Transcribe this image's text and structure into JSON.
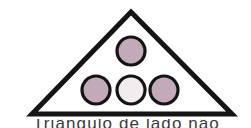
{
  "figure": {
    "background_color": "#ffffff",
    "stroke_color": "#141414",
    "caption": "Triângulo de lado não",
    "shapes": {
      "triangle": {
        "label": "triangle-outline",
        "apex": "131,12",
        "base_left": "32,114",
        "base_right": "232,114",
        "points": "131,12 232,114 32,114",
        "fill": "#ffffff",
        "stroke": "#141414",
        "stroke_width": 5
      },
      "circles": [
        {
          "label": "circle-top",
          "cx": 131,
          "cy": 51,
          "r": 14,
          "fill": "#c2aabb",
          "stroke": "#141414",
          "stroke_width": 3.2
        },
        {
          "label": "circle-bottom-left",
          "cx": 96,
          "cy": 90,
          "r": 14,
          "fill": "#c2aabb",
          "stroke": "#141414",
          "stroke_width": 3.2
        },
        {
          "label": "circle-bottom-middle",
          "cx": 131,
          "cy": 90,
          "r": 14,
          "fill": "#f2ecef",
          "stroke": "#141414",
          "stroke_width": 3.2
        },
        {
          "label": "circle-bottom-right",
          "cx": 164,
          "cy": 90,
          "r": 14,
          "fill": "#c2aabb",
          "stroke": "#141414",
          "stroke_width": 3.2
        }
      ]
    }
  }
}
